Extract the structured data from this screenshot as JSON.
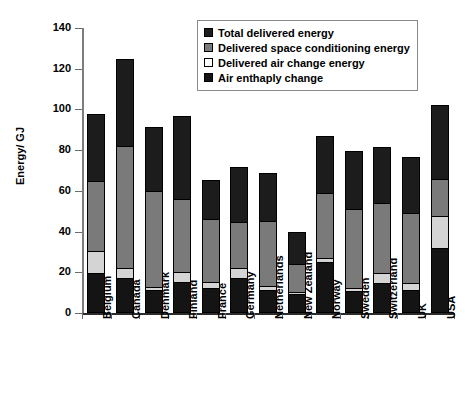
{
  "chart_data": {
    "type": "bar",
    "title": "",
    "subtitle": "",
    "xlabel": "",
    "ylabel": "Energy/ GJ",
    "ylim": [
      0,
      140
    ],
    "ytick_step": 20,
    "yticks": [
      0,
      20,
      40,
      60,
      80,
      100,
      120,
      140
    ],
    "ytick_labels": [
      "0",
      "20",
      "40",
      "60",
      "80",
      "100",
      "120",
      "140"
    ],
    "grid": false,
    "stacked_overlap": true,
    "legend_position": "top-center",
    "categories": [
      "Belgium",
      "Canada",
      "Denmark",
      "Finland",
      "France",
      "Germany",
      "Netherlands",
      "New Zealand",
      "Norway",
      "Sweden",
      "Switzerland",
      "UK",
      "USA"
    ],
    "series": [
      {
        "name": "Total delivered energy",
        "color": "#1c1c1c",
        "values": [
          98,
          125,
          91.5,
          97,
          65.5,
          71.5,
          69,
          40,
          87,
          79.5,
          81.5,
          76.5,
          102
        ]
      },
      {
        "name": "Delivered space conditioning energy",
        "color": "#7a7a7a",
        "values": [
          65,
          82,
          60,
          56,
          46,
          44.5,
          45,
          24,
          59,
          51,
          54,
          49,
          66
        ]
      },
      {
        "name": "Delivered air change energy",
        "color": "#d4d4d4",
        "values": [
          30.5,
          22,
          13,
          20,
          15,
          22,
          13.5,
          10.5,
          27,
          12.5,
          19.5,
          14.5,
          47.5
        ]
      },
      {
        "name": "Air enthaply change",
        "color": "#141414",
        "values": [
          19.5,
          17,
          11.5,
          15,
          12.5,
          17,
          11.5,
          9.5,
          25,
          11,
          14.5,
          11.5,
          32
        ]
      }
    ]
  },
  "legend": {
    "items": [
      {
        "label": "Total delivered energy",
        "swatch": "#1c1c1c"
      },
      {
        "label": "Delivered space conditioning energy",
        "swatch": "#7a7a7a"
      },
      {
        "label": "Delivered air change energy",
        "swatch": "#ffffff"
      },
      {
        "label": "Air enthaply change",
        "swatch": "#141414"
      }
    ]
  }
}
